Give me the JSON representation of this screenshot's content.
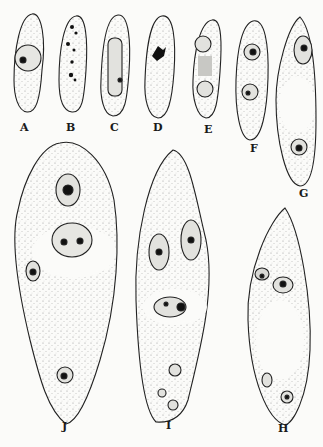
{
  "figure": {
    "panels": [
      {
        "id": "A",
        "label": "A",
        "x": 20,
        "y": 128
      },
      {
        "id": "B",
        "label": "B",
        "x": 66,
        "y": 126
      },
      {
        "id": "C",
        "label": "C",
        "x": 110,
        "y": 126
      },
      {
        "id": "D",
        "label": "D",
        "x": 153,
        "y": 127
      },
      {
        "id": "E",
        "label": "E",
        "x": 204,
        "y": 128
      },
      {
        "id": "F",
        "label": "F",
        "x": 250,
        "y": 147
      },
      {
        "id": "G",
        "label": "G",
        "x": 299,
        "y": 192
      },
      {
        "id": "J",
        "label": "J",
        "x": 62,
        "y": 425
      },
      {
        "id": "I",
        "label": "I",
        "x": 166,
        "y": 424
      },
      {
        "id": "H",
        "label": "H",
        "x": 278,
        "y": 427
      }
    ]
  }
}
